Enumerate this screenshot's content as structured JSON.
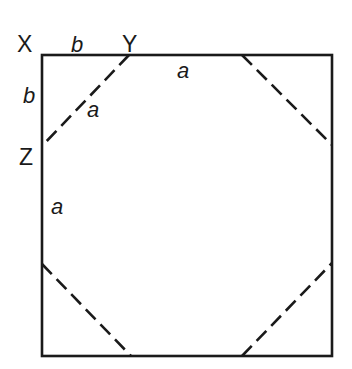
{
  "diagram": {
    "colors": {
      "stroke": "#1a1a1a",
      "background": "#ffffff"
    },
    "square": {
      "x1": 42,
      "y1": 55,
      "x2": 332,
      "y2": 356
    },
    "cuts": [
      {
        "name": "top-left-cut",
        "x1": 129,
        "y1": 55,
        "x2": 42,
        "y2": 146
      },
      {
        "name": "top-right-cut",
        "x1": 242,
        "y1": 55,
        "x2": 332,
        "y2": 145
      },
      {
        "name": "bottom-left-cut",
        "x1": 42,
        "y1": 264,
        "x2": 131,
        "y2": 356
      },
      {
        "name": "bottom-right-cut",
        "x1": 242,
        "y1": 356,
        "x2": 332,
        "y2": 263
      }
    ],
    "labels": {
      "point_x": "X",
      "point_y": "Y",
      "point_z": "Z",
      "segment_xy": "b",
      "segment_xz": "b",
      "segment_yz": "a",
      "octagon_top_side": "a",
      "octagon_left_side": "a"
    }
  }
}
